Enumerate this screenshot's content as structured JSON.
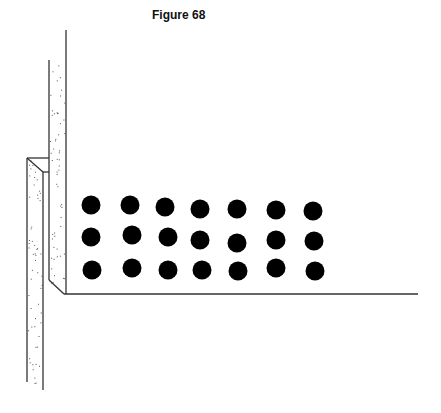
{
  "figure": {
    "title": "Figure 68"
  },
  "colors": {
    "line": "#333333",
    "dot": "#000000",
    "speckle": "#555555",
    "background": "#ffffff"
  },
  "diagram": {
    "dot_rows": 3,
    "dot_cols": 7,
    "dots": [
      {
        "x": 91,
        "y": 205
      },
      {
        "x": 130,
        "y": 205
      },
      {
        "x": 165,
        "y": 207
      },
      {
        "x": 200,
        "y": 209
      },
      {
        "x": 237,
        "y": 209
      },
      {
        "x": 276,
        "y": 210
      },
      {
        "x": 313,
        "y": 211
      },
      {
        "x": 91,
        "y": 237
      },
      {
        "x": 132,
        "y": 235
      },
      {
        "x": 168,
        "y": 237
      },
      {
        "x": 200,
        "y": 240
      },
      {
        "x": 237,
        "y": 243
      },
      {
        "x": 276,
        "y": 240
      },
      {
        "x": 314,
        "y": 241
      },
      {
        "x": 92,
        "y": 270
      },
      {
        "x": 132,
        "y": 268
      },
      {
        "x": 168,
        "y": 270
      },
      {
        "x": 202,
        "y": 270
      },
      {
        "x": 238,
        "y": 271
      },
      {
        "x": 276,
        "y": 268
      },
      {
        "x": 315,
        "y": 271
      }
    ]
  }
}
